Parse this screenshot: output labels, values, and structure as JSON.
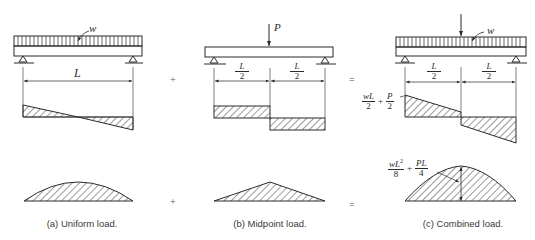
{
  "figure": {
    "panels": [
      {
        "id": "a",
        "caption": "(a) Uniform load.",
        "load_label": "w",
        "span_label": "L"
      },
      {
        "id": "b",
        "caption": "(b) Midpoint load.",
        "load_label": "P",
        "half_span_num": "L",
        "half_span_den": "2"
      },
      {
        "id": "c",
        "caption": "(c) Combined load.",
        "load_label": "w",
        "half_span_num": "L",
        "half_span_den": "2",
        "shear_annotation": {
          "term1_num": "wL",
          "term1_den": "2",
          "plus": "+",
          "term2_num": "P",
          "term2_den": "2"
        },
        "moment_annotation": {
          "term1_num": "wL",
          "term1_sup": "2",
          "term1_den": "8",
          "plus": "+",
          "term2_num": "PL",
          "term2_den": "4"
        }
      }
    ],
    "operators": {
      "plus": "+",
      "equals": "="
    },
    "colors": {
      "line": "#2a2a2a",
      "hatch": "#3a3a3a",
      "background": "#ffffff"
    }
  }
}
